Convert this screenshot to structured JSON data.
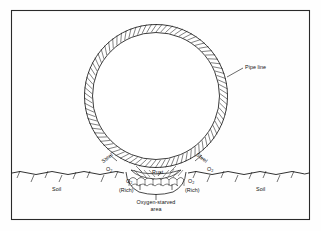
{
  "figure": {
    "frame_color": "#2a2a2a",
    "line_color": "#1a1a1a",
    "background": "#fefefe"
  },
  "labels": {
    "pipe_line": "Pipe line",
    "steel_left": "Steel",
    "steel_right": "Steel",
    "soil_left": "Soil",
    "soil_right": "Soil",
    "rust": "Rust",
    "o2_upper_left": "O",
    "o2_upper_left_sub": "2",
    "o2_upper_right": "O",
    "o2_upper_right_sub": "2",
    "o2_lower_left": "O",
    "o2_lower_left_sub": "2",
    "o2_lower_right": "O",
    "o2_lower_right_sub": "2",
    "rich_left": "(Rich)",
    "rich_right": "(Rich)",
    "oxygen_starved_line1": "Oxygen-starved",
    "oxygen_starved_line2": "area"
  },
  "geometry": {
    "frame": {
      "x": 11,
      "y": 10,
      "width": 299,
      "height": 210
    },
    "pipe": {
      "cx": 156,
      "cy": 96,
      "r_outer": 72,
      "r_inner": 64
    },
    "ground_line_y": 173,
    "pit": {
      "cx": 156,
      "left": 128,
      "right": 186,
      "depth_y": 193
    }
  }
}
